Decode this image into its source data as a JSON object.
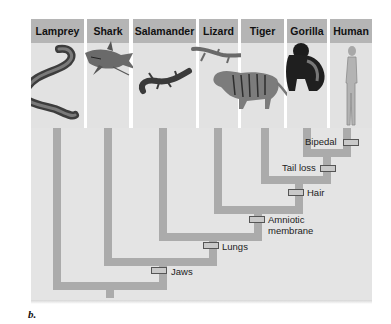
{
  "taxa": [
    {
      "name": "Lamprey",
      "icon": "lamprey-illustration"
    },
    {
      "name": "Shark",
      "icon": "shark-illustration"
    },
    {
      "name": "Salamander",
      "icon": "salamander-illustration"
    },
    {
      "name": "Lizard",
      "icon": "lizard-illustration"
    },
    {
      "name": "Tiger",
      "icon": "tiger-illustration"
    },
    {
      "name": "Gorilla",
      "icon": "gorilla-illustration"
    },
    {
      "name": "Human",
      "icon": "human-illustration"
    }
  ],
  "traits": [
    {
      "label": "Jaws"
    },
    {
      "label": "Lungs"
    },
    {
      "label": "Amniotic membrane",
      "line1": "Amniotic",
      "line2": "membrane"
    },
    {
      "label": "Hair"
    },
    {
      "label": "Tail loss"
    },
    {
      "label": "Bipedal"
    }
  ],
  "caption": "b.",
  "colors": {
    "header": "#b5b5b5",
    "panel": "#e2e2e2",
    "branch": "#ababab",
    "marker": "#c9c9c9"
  }
}
